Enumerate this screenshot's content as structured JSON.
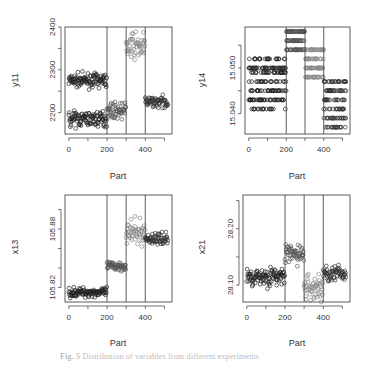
{
  "caption": {
    "label": "Fig. 5",
    "text": "Distribution of variables from different experiments"
  },
  "colors": {
    "group1": "#222222",
    "group2": "#555555",
    "group3": "#8a8a8a",
    "group4": "#333333",
    "boundary_line": "#333333",
    "axis": "#333333"
  },
  "chart_data": [
    {
      "type": "scatter",
      "id": "y11",
      "title": "",
      "xlabel": "Part",
      "ylabel": "y11",
      "xlim": [
        -20,
        540
      ],
      "ylim": [
        2150,
        2400
      ],
      "xticks": [
        0,
        100,
        200,
        300,
        400,
        500
      ],
      "xtick_labels": [
        "0",
        "200",
        "400"
      ],
      "yticks": [
        2200,
        2250,
        2300,
        2350,
        2400
      ],
      "ytick_labels": [
        "2200",
        "2300",
        "2400"
      ],
      "vlines": [
        200,
        300,
        400
      ],
      "series": [
        {
          "name": "Part 0-200 (upper)",
          "x_range": [
            0,
            200
          ],
          "y_center": 2275,
          "y_spread": 12,
          "color": "group1"
        },
        {
          "name": "Part 0-200 (lower)",
          "x_range": [
            0,
            200
          ],
          "y_center": 2185,
          "y_spread": 14,
          "color": "group1"
        },
        {
          "name": "Part 200-300",
          "x_range": [
            200,
            300
          ],
          "y_center": 2205,
          "y_spread": 14,
          "color": "group2"
        },
        {
          "name": "Part 300-400",
          "x_range": [
            300,
            400
          ],
          "y_center": 2355,
          "y_spread": 25,
          "color": "group3"
        },
        {
          "name": "Part 400-520",
          "x_range": [
            400,
            520
          ],
          "y_center": 2225,
          "y_spread": 10,
          "color": "group4"
        }
      ]
    },
    {
      "type": "scatter",
      "id": "y14",
      "title": "",
      "xlabel": "Part",
      "ylabel": "y14",
      "xlim": [
        -20,
        540
      ],
      "ylim": [
        15.0355,
        15.059
      ],
      "xticks": [
        0,
        100,
        200,
        300,
        400,
        500
      ],
      "xtick_labels": [
        "0",
        "200",
        "400"
      ],
      "yticks": [
        15.04,
        15.045,
        15.05,
        15.055
      ],
      "ytick_labels": [
        "15.040",
        "15.050"
      ],
      "vlines": [
        200,
        300,
        400
      ],
      "series": [
        {
          "name": "Part 0-200",
          "x_range": [
            0,
            200
          ],
          "levels": [
            15.041,
            15.043,
            15.045,
            15.047,
            15.049,
            15.05,
            15.052
          ],
          "color": "group1"
        },
        {
          "name": "Part 200-300",
          "x_range": [
            200,
            300
          ],
          "levels": [
            15.054,
            15.056,
            15.058
          ],
          "color": "group2"
        },
        {
          "name": "Part 300-400",
          "x_range": [
            300,
            400
          ],
          "levels": [
            15.048,
            15.05,
            15.052,
            15.054
          ],
          "color": "group3"
        },
        {
          "name": "Part 400-520",
          "x_range": [
            400,
            520
          ],
          "levels": [
            15.037,
            15.039,
            15.041,
            15.043,
            15.045,
            15.047
          ],
          "color": "group4"
        }
      ]
    },
    {
      "type": "scatter",
      "id": "x13",
      "title": "",
      "xlabel": "Part",
      "ylabel": "x13",
      "xlim": [
        -20,
        540
      ],
      "ylim": [
        105.805,
        105.915
      ],
      "xticks": [
        0,
        100,
        200,
        300,
        400,
        500
      ],
      "xtick_labels": [
        "0",
        "200",
        "400"
      ],
      "yticks": [
        105.82,
        105.84,
        105.86,
        105.88,
        105.9
      ],
      "ytick_labels": [
        "105.82",
        "105.88"
      ],
      "vlines": [
        200,
        300,
        400
      ],
      "series": [
        {
          "name": "Part 0-200",
          "x_range": [
            0,
            200
          ],
          "y_center": 105.815,
          "y_spread": 0.004,
          "color": "group1"
        },
        {
          "name": "Part 200-300",
          "x_range": [
            200,
            300
          ],
          "y_center": 105.842,
          "y_spread": 0.004,
          "color": "group2"
        },
        {
          "name": "Part 300-400",
          "x_range": [
            300,
            400
          ],
          "y_center": 105.876,
          "y_spread": 0.01,
          "color": "group3"
        },
        {
          "name": "Part 400-520",
          "x_range": [
            400,
            520
          ],
          "y_center": 105.87,
          "y_spread": 0.005,
          "color": "group4"
        }
      ]
    },
    {
      "type": "scatter",
      "id": "x21",
      "title": "",
      "xlabel": "Part",
      "ylabel": "x21",
      "xlim": [
        -20,
        540
      ],
      "ylim": [
        28.07,
        28.26
      ],
      "xticks": [
        0,
        100,
        200,
        300,
        400,
        500
      ],
      "xtick_labels": [
        "0",
        "200",
        "400"
      ],
      "yticks": [
        28.1,
        28.15,
        28.2,
        28.25
      ],
      "ytick_labels": [
        "28.10",
        "28.20"
      ],
      "vlines": [
        200,
        300,
        400
      ],
      "series": [
        {
          "name": "Part 0-200",
          "x_range": [
            0,
            200
          ],
          "y_center": 28.115,
          "y_spread": 0.013,
          "color": "group1"
        },
        {
          "name": "Part 200-300",
          "x_range": [
            200,
            300
          ],
          "y_center": 28.155,
          "y_spread": 0.015,
          "color": "group2"
        },
        {
          "name": "Part 300-400",
          "x_range": [
            300,
            400
          ],
          "y_center": 28.095,
          "y_spread": 0.02,
          "color": "group3"
        },
        {
          "name": "Part 400-520",
          "x_range": [
            400,
            520
          ],
          "y_center": 28.12,
          "y_spread": 0.012,
          "color": "group4"
        }
      ]
    }
  ],
  "panels": [
    {
      "ylabel": "y11",
      "xlabel": "Part",
      "yt": [
        "2200",
        "2300",
        "2400"
      ],
      "xt": [
        "0",
        "200",
        "400"
      ]
    },
    {
      "ylabel": "y14",
      "xlabel": "Part",
      "yt": [
        "15.040",
        "15.050"
      ],
      "xt": [
        "0",
        "200",
        "400"
      ]
    },
    {
      "ylabel": "x13",
      "xlabel": "Part",
      "yt": [
        "105.82",
        "105.88"
      ],
      "xt": [
        "0",
        "200",
        "400"
      ]
    },
    {
      "ylabel": "x21",
      "xlabel": "Part",
      "yt": [
        "28.10",
        "28.20"
      ],
      "xt": [
        "0",
        "200",
        "400"
      ]
    }
  ]
}
